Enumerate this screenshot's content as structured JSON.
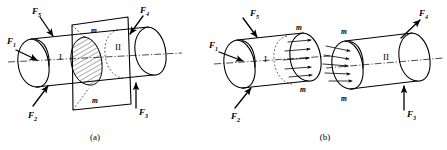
{
  "figure": {
    "captions": [
      {
        "id": "cap-a",
        "text": "(a)"
      },
      {
        "id": "cap-b",
        "text": "(b)"
      }
    ],
    "section_label": "m",
    "parts": {
      "left": "I",
      "right": "II"
    },
    "forces": {
      "f1": "F",
      "f1_sub": "1",
      "f2": "F",
      "f2_sub": "2",
      "f3": "F",
      "f3_sub": "3",
      "f4": "F",
      "f4_sub": "4",
      "f5": "F",
      "f5_sub": "5"
    },
    "panel_a": {
      "name": "whole-body-with-cutting-plane",
      "force_labels": [
        "F1",
        "F2",
        "F3",
        "F4",
        "F5"
      ],
      "section_marks": [
        "m",
        "m"
      ],
      "part_labels": [
        "I",
        "II"
      ],
      "hatched_section": true
    },
    "panel_b": {
      "name": "separated-free-bodies",
      "left_body": {
        "part_label": "I",
        "external_forces": [
          "F1",
          "F2",
          "F5"
        ],
        "section_marks": [
          "m",
          "m"
        ],
        "internal_force_arrows": 5,
        "internal_force_direction": "right"
      },
      "right_body": {
        "part_label": "II",
        "external_forces": [
          "F3",
          "F4"
        ],
        "section_marks": [
          "m",
          "m"
        ],
        "internal_force_arrows": 5,
        "internal_force_direction": "right"
      }
    },
    "colors": {
      "ink": "#000000",
      "background": "#ffffff"
    }
  }
}
